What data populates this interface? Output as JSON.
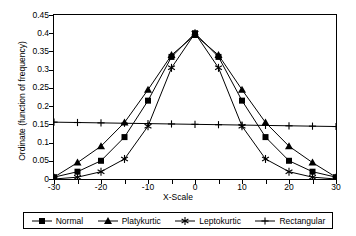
{
  "chart_data": {
    "type": "line",
    "title": "",
    "xlabel": "X-Scale",
    "ylabel": "Ordinate (function of frequency)",
    "xlim": [
      -30,
      30
    ],
    "ylim": [
      0,
      0.45
    ],
    "grid": false,
    "legend_position": "bottom",
    "x_ticks": [
      -30,
      -25,
      -20,
      -15,
      -10,
      -5,
      0,
      5,
      10,
      15,
      20,
      25,
      30
    ],
    "x_tick_labels": [
      "-30",
      "",
      "-20",
      "",
      "-10",
      "",
      "0",
      "",
      "10",
      "",
      "20",
      "",
      "30"
    ],
    "y_ticks": [
      0,
      0.05,
      0.1,
      0.15,
      0.2,
      0.25,
      0.3,
      0.35,
      0.4,
      0.45
    ],
    "y_tick_labels": [
      "0",
      "0.05",
      "0.1",
      "0.15",
      "0.2",
      "0.25",
      "0.3",
      "0.35",
      "0.4",
      "0.45"
    ],
    "x": [
      -30,
      -25,
      -20,
      -15,
      -10,
      -5,
      0,
      5,
      10,
      15,
      20,
      25,
      30
    ],
    "series": [
      {
        "name": "Normal",
        "marker": "square",
        "values": [
          0.005,
          0.02,
          0.05,
          0.115,
          0.215,
          0.335,
          0.4,
          0.335,
          0.215,
          0.115,
          0.05,
          0.02,
          0.005
        ]
      },
      {
        "name": "Platykurtic",
        "marker": "triangle",
        "values": [
          0.005,
          0.045,
          0.09,
          0.155,
          0.245,
          0.34,
          0.395,
          0.34,
          0.245,
          0.155,
          0.09,
          0.045,
          0.005
        ]
      },
      {
        "name": "Leptokurtic",
        "marker": "asterisk",
        "values": [
          0.0,
          0.005,
          0.02,
          0.055,
          0.145,
          0.305,
          0.4,
          0.305,
          0.145,
          0.055,
          0.02,
          0.005,
          0.0
        ]
      },
      {
        "name": "Rectangular",
        "marker": "plus",
        "values": [
          0.156,
          0.155,
          0.154,
          0.153,
          0.152,
          0.151,
          0.15,
          0.149,
          0.148,
          0.147,
          0.146,
          0.145,
          0.144
        ]
      }
    ]
  },
  "legend": {
    "items": [
      {
        "label": "Normal"
      },
      {
        "label": "Platykurtic"
      },
      {
        "label": "Leptokurtic"
      },
      {
        "label": "Rectangular"
      }
    ]
  },
  "colors": {
    "line": "#000000",
    "axis": "#000000",
    "background": "#ffffff"
  }
}
